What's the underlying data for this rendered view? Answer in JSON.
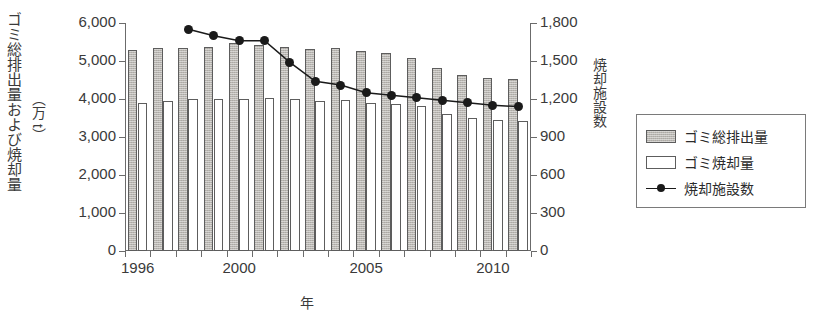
{
  "chart_data": {
    "type": "bar",
    "title": "",
    "xlabel": "年",
    "ylabel": "ゴミ総排出量および焼却量",
    "ylabel_unit": "（万 t）",
    "y2label": "焼却施設数",
    "categories": [
      1996,
      1997,
      1998,
      1999,
      2000,
      2001,
      2002,
      2003,
      2004,
      2005,
      2006,
      2007,
      2008,
      2009,
      2010,
      2011
    ],
    "xtick_labels": [
      "1996",
      "2000",
      "2005",
      "2010"
    ],
    "xtick_values": [
      1996,
      2000,
      2005,
      2010
    ],
    "ylim": [
      0,
      6000
    ],
    "ytick_labels": [
      "0",
      "1,000",
      "2,000",
      "3,000",
      "4,000",
      "5,000",
      "6,000"
    ],
    "ytick_values": [
      0,
      1000,
      2000,
      3000,
      4000,
      5000,
      6000
    ],
    "y2lim": [
      0,
      1800
    ],
    "y2tick_labels": [
      "0",
      "300",
      "600",
      "900",
      "1,200",
      "1,500",
      "1,800"
    ],
    "y2tick_values": [
      0,
      300,
      600,
      900,
      1200,
      1500,
      1800
    ],
    "grid": false,
    "legend_position": "right-outside",
    "series": [
      {
        "name": "ゴミ総排出量",
        "kind": "bar",
        "axis": "left",
        "style": "filled-gray",
        "values": [
          5280,
          5330,
          5350,
          5370,
          5480,
          5430,
          5360,
          5310,
          5340,
          5270,
          5200,
          5080,
          4810,
          4620,
          4540,
          4520
        ]
      },
      {
        "name": "ゴミ焼却量",
        "kind": "bar",
        "axis": "left",
        "style": "white-outline",
        "values": [
          3890,
          3950,
          3990,
          3990,
          4010,
          4020,
          3990,
          3940,
          3980,
          3900,
          3870,
          3820,
          3600,
          3490,
          3450,
          3420
        ]
      },
      {
        "name": "焼却施設数",
        "kind": "line",
        "axis": "right",
        "style": "black-dot-line",
        "x": [
          1998,
          1999,
          2000,
          2001,
          2002,
          2003,
          2004,
          2005,
          2006,
          2007,
          2008,
          2009,
          2010,
          2011
        ],
        "values": [
          1750,
          1700,
          1660,
          1660,
          1490,
          1340,
          1310,
          1250,
          1230,
          1210,
          1190,
          1170,
          1150,
          1140
        ]
      }
    ]
  },
  "legend": {
    "items": [
      {
        "label": "ゴミ総排出量",
        "swatch": "filled-gray-swatch"
      },
      {
        "label": "ゴミ焼却量",
        "swatch": "white-swatch"
      },
      {
        "label": "焼却施設数",
        "swatch": "line-dot-swatch"
      }
    ]
  }
}
